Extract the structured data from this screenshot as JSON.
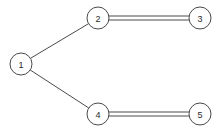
{
  "figure": {
    "name": "undirected-multigraph",
    "background_color": "#ffffff",
    "stroke_color": "#4a4a4a",
    "label_color": "#2b2b2b",
    "width": 220,
    "height": 134
  },
  "graph": {
    "node_radius": 11,
    "parallel_edge_offset": 2,
    "nodes": [
      {
        "id": "1",
        "label": "1",
        "x": 21,
        "y": 64
      },
      {
        "id": "2",
        "label": "2",
        "x": 98,
        "y": 18
      },
      {
        "id": "3",
        "label": "3",
        "x": 200,
        "y": 18
      },
      {
        "id": "4",
        "label": "4",
        "x": 98,
        "y": 114
      },
      {
        "id": "5",
        "label": "5",
        "x": 200,
        "y": 114
      }
    ],
    "edges": [
      {
        "id": "edge-1-2",
        "source": "1",
        "target": "2",
        "multiplicity": 1,
        "style": "single"
      },
      {
        "id": "edge-1-4",
        "source": "1",
        "target": "4",
        "multiplicity": 1,
        "style": "single"
      },
      {
        "id": "edge-2-3",
        "source": "2",
        "target": "3",
        "multiplicity": 2,
        "style": "double"
      },
      {
        "id": "edge-4-5",
        "source": "4",
        "target": "5",
        "multiplicity": 2,
        "style": "double"
      }
    ]
  }
}
